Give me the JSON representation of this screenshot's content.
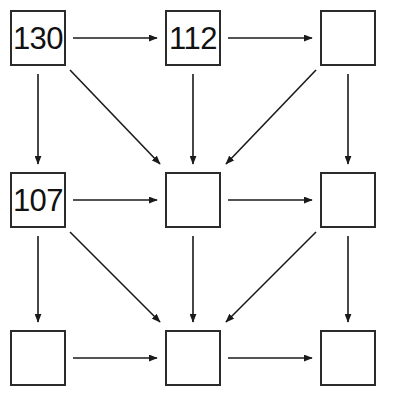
{
  "diagram": {
    "type": "grid-flow-diagram",
    "title": "",
    "background_color": "#ffffff",
    "box_border_color": "#2b2b2b",
    "arrow_color": "#1a1a1a",
    "text_color": "#111111",
    "grid": {
      "rows": 3,
      "cols": 3,
      "box_size": 56,
      "col_x": [
        10,
        165,
        320
      ],
      "row_y": [
        10,
        172,
        330
      ]
    },
    "boxes": [
      {
        "id": "box-r0c0",
        "row": 0,
        "col": 0,
        "label": "130",
        "empty": false
      },
      {
        "id": "box-r0c1",
        "row": 0,
        "col": 1,
        "label": "112",
        "empty": false
      },
      {
        "id": "box-r0c2",
        "row": 0,
        "col": 2,
        "label": "",
        "empty": true
      },
      {
        "id": "box-r1c0",
        "row": 1,
        "col": 0,
        "label": "107",
        "empty": false
      },
      {
        "id": "box-r1c1",
        "row": 1,
        "col": 1,
        "label": "",
        "empty": true
      },
      {
        "id": "box-r1c2",
        "row": 1,
        "col": 2,
        "label": "",
        "empty": true
      },
      {
        "id": "box-r2c0",
        "row": 2,
        "col": 0,
        "label": "",
        "empty": true
      },
      {
        "id": "box-r2c1",
        "row": 2,
        "col": 1,
        "label": "",
        "empty": true
      },
      {
        "id": "box-r2c2",
        "row": 2,
        "col": 2,
        "label": "",
        "empty": true
      }
    ],
    "arrows": [
      {
        "id": "arrow-r0c0-to-r0c1",
        "kind": "horizontal",
        "from": "box-r0c0",
        "to": "box-r0c1",
        "x1": 73,
        "y1": 38,
        "x2": 157,
        "y2": 38
      },
      {
        "id": "arrow-r0c1-to-r0c2",
        "kind": "horizontal",
        "from": "box-r0c1",
        "to": "box-r0c2",
        "x1": 228,
        "y1": 38,
        "x2": 312,
        "y2": 38
      },
      {
        "id": "arrow-r1c0-to-r1c1",
        "kind": "horizontal",
        "from": "box-r1c0",
        "to": "box-r1c1",
        "x1": 73,
        "y1": 200,
        "x2": 157,
        "y2": 200
      },
      {
        "id": "arrow-r1c1-to-r1c2",
        "kind": "horizontal",
        "from": "box-r1c1",
        "to": "box-r1c2",
        "x1": 228,
        "y1": 200,
        "x2": 312,
        "y2": 200
      },
      {
        "id": "arrow-r2c0-to-r2c1",
        "kind": "horizontal",
        "from": "box-r2c0",
        "to": "box-r2c1",
        "x1": 73,
        "y1": 358,
        "x2": 157,
        "y2": 358
      },
      {
        "id": "arrow-r2c1-to-r2c2",
        "kind": "horizontal",
        "from": "box-r2c1",
        "to": "box-r2c2",
        "x1": 228,
        "y1": 358,
        "x2": 312,
        "y2": 358
      },
      {
        "id": "arrow-r0c0-to-r1c0",
        "kind": "vertical",
        "from": "box-r0c0",
        "to": "box-r1c0",
        "x1": 38,
        "y1": 74,
        "x2": 38,
        "y2": 164
      },
      {
        "id": "arrow-r0c1-to-r1c1",
        "kind": "vertical",
        "from": "box-r0c1",
        "to": "box-r1c1",
        "x1": 193,
        "y1": 74,
        "x2": 193,
        "y2": 164
      },
      {
        "id": "arrow-r0c2-to-r1c2",
        "kind": "vertical",
        "from": "box-r0c2",
        "to": "box-r1c2",
        "x1": 348,
        "y1": 74,
        "x2": 348,
        "y2": 164
      },
      {
        "id": "arrow-r1c0-to-r2c0",
        "kind": "vertical",
        "from": "box-r1c0",
        "to": "box-r2c0",
        "x1": 38,
        "y1": 236,
        "x2": 38,
        "y2": 322
      },
      {
        "id": "arrow-r1c1-to-r2c1",
        "kind": "vertical",
        "from": "box-r1c1",
        "to": "box-r2c1",
        "x1": 193,
        "y1": 236,
        "x2": 193,
        "y2": 322
      },
      {
        "id": "arrow-r1c2-to-r2c2",
        "kind": "vertical",
        "from": "box-r1c2",
        "to": "box-r2c2",
        "x1": 348,
        "y1": 236,
        "x2": 348,
        "y2": 322
      },
      {
        "id": "arrow-r0c0-to-r1c1",
        "kind": "diagonal-down-right",
        "from": "box-r0c0",
        "to": "box-r1c1",
        "x1": 70,
        "y1": 70,
        "x2": 160,
        "y2": 164
      },
      {
        "id": "arrow-r1c0-to-r2c1",
        "kind": "diagonal-down-right",
        "from": "box-r1c0",
        "to": "box-r2c1",
        "x1": 70,
        "y1": 232,
        "x2": 160,
        "y2": 322
      },
      {
        "id": "arrow-r0c2-to-r1c1",
        "kind": "diagonal-down-left",
        "from": "box-r0c2",
        "to": "box-r1c1",
        "x1": 316,
        "y1": 70,
        "x2": 226,
        "y2": 164
      },
      {
        "id": "arrow-r1c2-to-r2c1",
        "kind": "diagonal-down-left",
        "from": "box-r1c2",
        "to": "box-r2c1",
        "x1": 316,
        "y1": 232,
        "x2": 226,
        "y2": 322
      }
    ]
  }
}
